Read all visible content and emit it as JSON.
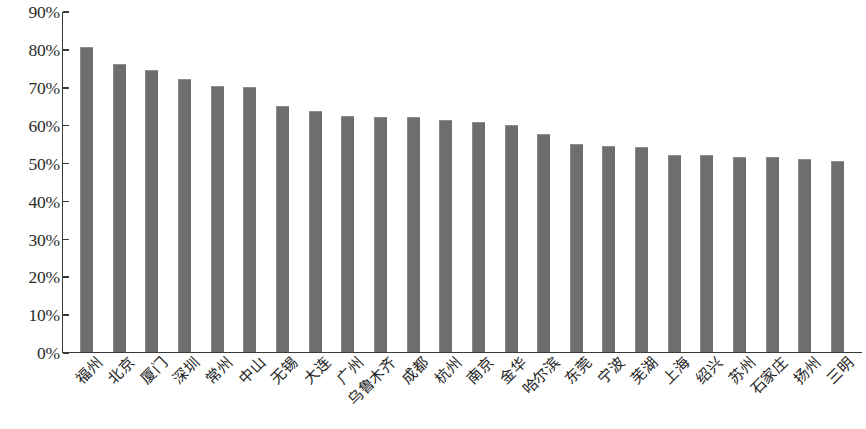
{
  "chart_data": {
    "type": "bar",
    "title": "",
    "subtitle": "",
    "xlabel": "",
    "ylabel": "",
    "ylim": [
      0,
      90
    ],
    "y_ticks": [
      "0%",
      "10%",
      "20%",
      "30%",
      "40%",
      "50%",
      "60%",
      "70%",
      "80%",
      "90%"
    ],
    "y_tick_values": [
      0,
      10,
      20,
      30,
      40,
      50,
      60,
      70,
      80,
      90
    ],
    "grid": false,
    "legend": null,
    "legend_position": "none",
    "bar_color": "#6e6e6e",
    "axis_color": "#3a3a3a",
    "categories": [
      "福州",
      "北京",
      "厦门",
      "深圳",
      "常州",
      "中山",
      "无锡",
      "大连",
      "广州",
      "乌鲁木齐",
      "成都",
      "杭州",
      "南京",
      "金华",
      "哈尔滨",
      "东莞",
      "宁波",
      "芜湖",
      "上海",
      "绍兴",
      "苏州",
      "石家庄",
      "扬州",
      "三明"
    ],
    "values": [
      80.5,
      76.0,
      74.5,
      72.0,
      70.3,
      70.0,
      65.0,
      63.5,
      62.3,
      62.0,
      62.0,
      61.3,
      60.7,
      60.0,
      57.5,
      55.0,
      54.5,
      54.0,
      52.0,
      52.0,
      51.6,
      51.5,
      51.0,
      50.5
    ]
  }
}
